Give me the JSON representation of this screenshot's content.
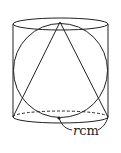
{
  "diagram": {
    "type": "geometry-figure",
    "shapes": [
      "cylinder",
      "sphere",
      "cone"
    ],
    "label": {
      "variable": "r",
      "unit": "cm"
    },
    "colors": {
      "stroke": "#222222",
      "background": "#ffffff"
    }
  }
}
